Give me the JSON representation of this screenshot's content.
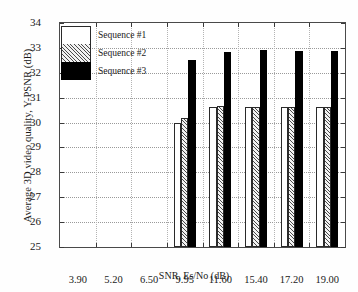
{
  "chart_data": {
    "type": "bar",
    "title": "",
    "xlabel": "SNR, Es/No (dB)",
    "ylabel": "Average 3D video quality, Y-PSNR (dB)",
    "categories": [
      "3.90",
      "5.20",
      "6.50",
      "9.95",
      "11.60",
      "15.40",
      "17.20",
      "19.00"
    ],
    "series": [
      {
        "name": "Sequence #1",
        "values": [
          null,
          null,
          null,
          29.98,
          30.62,
          30.62,
          30.62,
          30.62
        ]
      },
      {
        "name": "Sequence #2",
        "values": [
          null,
          null,
          null,
          30.2,
          30.68,
          30.62,
          30.62,
          30.62
        ]
      },
      {
        "name": "Sequence #3",
        "values": [
          null,
          null,
          null,
          32.5,
          32.82,
          32.9,
          32.88,
          32.88
        ]
      }
    ],
    "ylim": [
      25,
      34
    ],
    "yticks": [
      25,
      26,
      27,
      28,
      29,
      30,
      31,
      32,
      33,
      34
    ],
    "ytick_labels": [
      "25",
      "26",
      "27",
      "28",
      "29",
      "30",
      "31",
      "32",
      "33",
      "34"
    ],
    "grid": true,
    "legend_position": "upper-left",
    "legend_entries": [
      "Sequence #1",
      "Sequence #2",
      "Sequence #3"
    ],
    "series_colors": [
      "#ffffff",
      "#cccccc",
      "#000000"
    ]
  }
}
